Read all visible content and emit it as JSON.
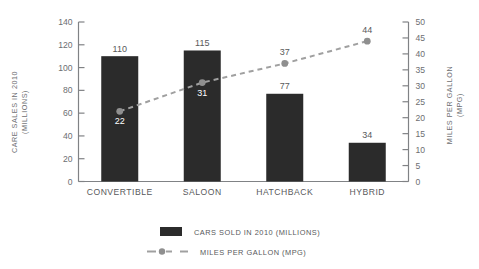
{
  "chart_data": {
    "type": "bar",
    "title": "",
    "subtitle": "",
    "categories": [
      "CONVERTIBLE",
      "SALOON",
      "HATCHBACK",
      "HYBRID"
    ],
    "xlabel": "",
    "ylabel": "CARE SALES IN 2010 (MILLIONS)",
    "ylabel_line1": "CARE SALES IN 2010",
    "ylabel_line2": "(MILLIONS)",
    "y2label": "MILES PER GALLON (MPG)",
    "y2label_line1": "MILES PER GALLON",
    "y2label_line2": "(MPG)",
    "ylim": [
      0,
      140
    ],
    "y2lim": [
      0,
      50
    ],
    "yticks": [
      0,
      20,
      40,
      60,
      80,
      100,
      120,
      140
    ],
    "ytick_labels": [
      "0",
      "20",
      "40",
      "60",
      "80",
      "100",
      "120",
      "140"
    ],
    "y2ticks": [
      0,
      5,
      10,
      15,
      20,
      25,
      30,
      35,
      40,
      45,
      50
    ],
    "y2tick_labels": [
      "0",
      "5",
      "10",
      "15",
      "20",
      "25",
      "30",
      "35",
      "40",
      "45",
      "50"
    ],
    "grid": false,
    "legend_position": "bottom",
    "series": [
      {
        "name": "CARS SOLD IN 2010 (MILLIONS)",
        "kind": "bar",
        "axis": "left",
        "color": "#2b2b2b",
        "values": [
          110,
          115,
          77,
          34
        ],
        "value_labels": [
          "110",
          "115",
          "77",
          "34"
        ]
      },
      {
        "name": "MILES PER GALLON (MPG)",
        "kind": "line",
        "axis": "right",
        "color": "#a0a0a0",
        "style": "dashed",
        "marker": "circle",
        "values": [
          22,
          31,
          37,
          44
        ],
        "value_labels": [
          "22",
          "31",
          "37",
          "44"
        ],
        "label_placement": [
          "inside-below",
          "inside-below",
          "outside-above",
          "outside-above"
        ]
      }
    ],
    "legend": [
      {
        "label": "CARS SOLD IN 2010 (MILLIONS)",
        "swatch": "bar",
        "color": "#2b2b2b"
      },
      {
        "label": "MILES PER GALLON (MPG)",
        "swatch": "dashed-line-marker",
        "color": "#a0a0a0"
      }
    ]
  },
  "colors": {
    "background": "#ffffff",
    "bar": "#2b2b2b",
    "line": "#a0a0a0",
    "axis": "#808285",
    "text": "#58595b",
    "tick_text": "#6d6e71"
  }
}
